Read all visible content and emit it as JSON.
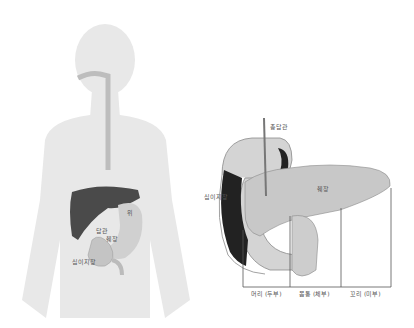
{
  "body_figure": {
    "labels": {
      "stomach": "위",
      "bile_duct": "담관",
      "pancreas": "췌장",
      "duodenum": "십이지장"
    }
  },
  "pancreas_figure": {
    "labels": {
      "common_bile_duct": "총담관",
      "duodenum": "십이지장",
      "pancreas": "췌장"
    },
    "sections": [
      {
        "label": "머리 (두부)"
      },
      {
        "label": "몸통 (체부)"
      },
      {
        "label": "꼬리 (미부)"
      }
    ]
  },
  "colors": {
    "silhouette": "#e6e6e6",
    "liver": "#4a4a4a",
    "organ_light": "#cfcfcf",
    "organ_dark": "#2a2a2a",
    "line": "#555555"
  }
}
